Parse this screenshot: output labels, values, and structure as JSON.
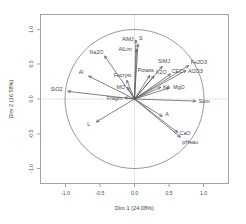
{
  "chart_data": {
    "type": "scatter",
    "title": "",
    "subtitle": "",
    "xlabel": "Dim 1 (24.08%)",
    "ylabel": "Dim 2 (16.58%)",
    "xlim": [
      -1.2,
      1.2
    ],
    "ylim": [
      -1.2,
      1.2
    ],
    "xticks": [
      "-1.0",
      "-0.5",
      "0.0",
      "0.5",
      "1.0"
    ],
    "xtick_values": [
      -1.0,
      -0.5,
      0.0,
      0.5,
      1.0
    ],
    "yticks": [
      "-1.0",
      "-0.5",
      "0.0",
      "0.5",
      "1.0"
    ],
    "ytick_values": [
      -1.0,
      -0.5,
      0.0,
      0.5,
      1.0
    ],
    "grid": false,
    "legend": "none",
    "correlation_circle_radius": 1.0,
    "annotations": [
      "Correlation circle of radius 1",
      "Dashed guide lines at x = 0 and y = 0"
    ],
    "variables": [
      {
        "name": "AlMJ",
        "x": 0.05,
        "y": 0.79,
        "label_dx": -16,
        "label_dy": -3
      },
      {
        "name": "AlLim",
        "x": 0.03,
        "y": 0.72,
        "label_dx": -18,
        "label_dy": 2
      },
      {
        "name": "S",
        "x": 0.02,
        "y": 0.85,
        "label_dx": 3,
        "label_dy": 0
      },
      {
        "name": "Na2O",
        "x": -0.43,
        "y": 0.62,
        "label_dx": -15,
        "label_dy": -2
      },
      {
        "name": "Al",
        "x": -0.66,
        "y": 0.33,
        "label_dx": -10,
        "label_dy": -2
      },
      {
        "name": "SiO2",
        "x": -0.96,
        "y": 0.11,
        "label_dx": -17,
        "label_dy": 0
      },
      {
        "name": "Fecryst",
        "x": -0.11,
        "y": 0.27,
        "label_dx": -13,
        "label_dy": -3
      },
      {
        "name": "MO",
        "x": -0.1,
        "y": 0.17,
        "label_dx": -11,
        "label_dy": 2
      },
      {
        "name": "Fragm",
        "x": -0.14,
        "y": 0.02,
        "label_dx": -18,
        "label_dy": 2
      },
      {
        "name": "Potass",
        "x": 0.22,
        "y": 0.34,
        "label_dx": -12,
        "label_dy": -3
      },
      {
        "name": "K2O",
        "x": 0.28,
        "y": 0.33,
        "label_dx": 2,
        "label_dy": -2
      },
      {
        "name": "SiMJ",
        "x": 0.4,
        "y": 0.47,
        "label_dx": -4,
        "label_dy": -3
      },
      {
        "name": "CEC",
        "x": 0.52,
        "y": 0.36,
        "label_dx": 1,
        "label_dy": -1
      },
      {
        "name": "Fe2O3",
        "x": 0.78,
        "y": 0.48,
        "label_dx": 2,
        "label_dy": -2
      },
      {
        "name": "Al2O3",
        "x": 0.74,
        "y": 0.41,
        "label_dx": 2,
        "label_dy": 2
      },
      {
        "name": "Kd",
        "x": 0.38,
        "y": 0.17,
        "label_dx": 2,
        "label_dy": 2
      },
      {
        "name": "MgO",
        "x": 0.5,
        "y": 0.16,
        "label_dx": 4,
        "label_dy": 1
      },
      {
        "name": "Sum",
        "x": 0.88,
        "y": -0.03,
        "label_dx": 3,
        "label_dy": 2
      },
      {
        "name": "A",
        "x": 0.4,
        "y": -0.25,
        "label_dx": 3,
        "label_dy": 0
      },
      {
        "name": "CaO",
        "x": 0.62,
        "y": -0.48,
        "label_dx": 2,
        "label_dy": 3
      },
      {
        "name": "pHeau",
        "x": 0.66,
        "y": -0.55,
        "label_dx": 2,
        "label_dy": 7
      },
      {
        "name": "L",
        "x": -0.55,
        "y": -0.33,
        "label_dx": -9,
        "label_dy": 4
      }
    ]
  },
  "colors": {
    "frame": "#8d8d8d",
    "circle": "#7d7d7d",
    "arrow": "#5a5a5a",
    "guide": "#b4b4b4",
    "text": "#444444",
    "background": "#ffffff"
  }
}
